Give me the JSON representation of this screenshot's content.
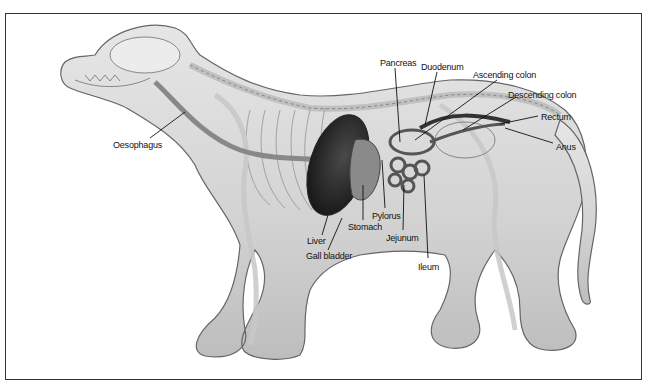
{
  "diagram": {
    "labels": [
      {
        "id": "oesophagus",
        "text": "Oesophagus",
        "x": 113,
        "y": 140,
        "pointer": [
          [
            150,
            138
          ],
          [
            185,
            112
          ]
        ]
      },
      {
        "id": "pancreas",
        "text": "Pancreas",
        "x": 380,
        "y": 58,
        "pointer": [
          [
            395,
            68
          ],
          [
            400,
            142
          ]
        ]
      },
      {
        "id": "duodenum",
        "text": "Duodenum",
        "x": 421,
        "y": 62,
        "pointer": [
          [
            437,
            72
          ],
          [
            425,
            125
          ]
        ]
      },
      {
        "id": "ascending-colon",
        "text": "Ascending colon",
        "x": 473,
        "y": 70,
        "pointer": [
          [
            497,
            80
          ],
          [
            415,
            140
          ]
        ]
      },
      {
        "id": "descending-colon",
        "text": "Descending colon",
        "x": 508,
        "y": 90,
        "pointer": [
          [
            516,
            97
          ],
          [
            463,
            130
          ]
        ]
      },
      {
        "id": "rectum",
        "text": "Rectum",
        "x": 541,
        "y": 112,
        "pointer": [
          [
            538,
            116
          ],
          [
            500,
            124
          ]
        ]
      },
      {
        "id": "anus",
        "text": "Anus",
        "x": 556,
        "y": 142,
        "pointer": [
          [
            553,
            143
          ],
          [
            505,
            128
          ]
        ]
      },
      {
        "id": "pylorus",
        "text": "Pylorus",
        "x": 372,
        "y": 211,
        "pointer": [
          [
            385,
            208
          ],
          [
            382,
            160
          ]
        ]
      },
      {
        "id": "stomach",
        "text": "Stomach",
        "x": 348,
        "y": 222,
        "pointer": [
          [
            363,
            220
          ],
          [
            363,
            185
          ]
        ]
      },
      {
        "id": "jejunum",
        "text": "Jejunum",
        "x": 386,
        "y": 233,
        "pointer": [
          [
            403,
            230
          ],
          [
            404,
            185
          ]
        ]
      },
      {
        "id": "liver",
        "text": "Liver",
        "x": 307,
        "y": 236,
        "pointer": [
          [
            322,
            235
          ],
          [
            328,
            215
          ]
        ]
      },
      {
        "id": "gall-bladder",
        "text": "Gall bladder",
        "x": 306,
        "y": 251,
        "pointer": [
          [
            328,
            250
          ],
          [
            342,
            218
          ]
        ]
      },
      {
        "id": "ileum",
        "text": "Ileum",
        "x": 418,
        "y": 262,
        "pointer": [
          [
            428,
            258
          ],
          [
            424,
            175
          ]
        ]
      }
    ]
  }
}
